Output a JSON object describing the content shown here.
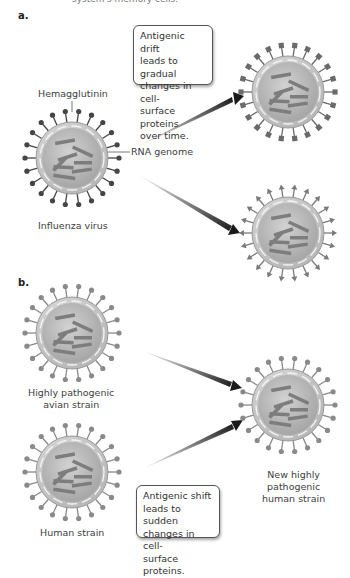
{
  "header": {
    "cut_text": "system's memory cells."
  },
  "panel_a": {
    "label": "a.",
    "box_text_lines": [
      "Antigenic drift",
      "leads to gradual",
      "changes in cell-",
      "surface proteins",
      "over time."
    ],
    "hemagglutinin_label": "Hemagglutinin",
    "rna_label": "RNA genome",
    "virus_label": "Influenza virus"
  },
  "panel_b": {
    "label": "b.",
    "avian_label_lines": [
      "Highly pathogenic",
      "avian strain"
    ],
    "human_label": "Human strain",
    "new_label_lines": [
      "New highly",
      "pathogenic",
      "human strain"
    ],
    "box_text_lines": [
      "Antigenic shift",
      "leads to sudden",
      "changes in cell-",
      "surface proteins."
    ]
  },
  "colors": {
    "virus_fill": "#b8b8b8",
    "virus_rim": "#d4d4d4",
    "rna": "#7d7d7d",
    "spike_dark": "#4a4a4a",
    "spike_light": "#8a8a8a",
    "arrow": "#1a1a1a"
  }
}
